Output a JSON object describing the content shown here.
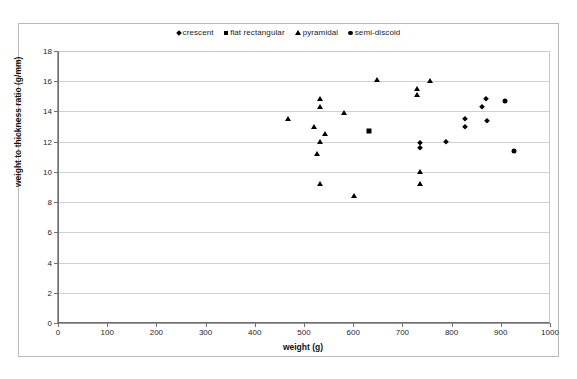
{
  "chart_data": {
    "type": "scatter",
    "title": "",
    "xlabel": "weight (g)",
    "ylabel": "weight to thickness ratio (g/mm)",
    "xlim": [
      0,
      1000
    ],
    "ylim": [
      0,
      18
    ],
    "xticks": [
      0,
      100,
      200,
      300,
      400,
      500,
      600,
      700,
      800,
      900,
      1000
    ],
    "yticks": [
      0,
      2,
      4,
      6,
      8,
      10,
      12,
      14,
      16,
      18
    ],
    "grid": "horizontal",
    "legend_position": "top-center",
    "series": [
      {
        "name": "crescent",
        "marker": "diamond",
        "color": "#000000",
        "points": [
          [
            827,
            13.5
          ],
          [
            827,
            13.0
          ],
          [
            870,
            14.8
          ],
          [
            862,
            14.3
          ],
          [
            872,
            13.4
          ],
          [
            736,
            11.9
          ],
          [
            736,
            11.6
          ],
          [
            789,
            12.0
          ]
        ]
      },
      {
        "name": "flat rectangular",
        "marker": "square",
        "color": "#000000",
        "points": [
          [
            633,
            12.7
          ]
        ]
      },
      {
        "name": "pyramidal",
        "marker": "triangle",
        "color": "#000000",
        "points": [
          [
            467,
            13.5
          ],
          [
            533,
            14.8
          ],
          [
            533,
            14.3
          ],
          [
            520,
            13.0
          ],
          [
            543,
            12.5
          ],
          [
            533,
            12.0
          ],
          [
            527,
            11.2
          ],
          [
            533,
            9.2
          ],
          [
            582,
            13.9
          ],
          [
            648,
            16.1
          ],
          [
            601,
            8.4
          ],
          [
            756,
            16.0
          ],
          [
            730,
            15.5
          ],
          [
            730,
            15.1
          ],
          [
            736,
            10.0
          ],
          [
            736,
            9.2
          ]
        ]
      },
      {
        "name": "semi-discoid",
        "marker": "circle",
        "color": "#000000",
        "points": [
          [
            908,
            14.7
          ],
          [
            927,
            11.4
          ]
        ]
      }
    ]
  },
  "legend": {
    "items": [
      {
        "label": "crescent",
        "marker": "diamond"
      },
      {
        "label": "flat rectangular",
        "marker": "square"
      },
      {
        "label": "pyramidal",
        "marker": "triangle"
      },
      {
        "label": "semi-discoid",
        "marker": "circle"
      }
    ]
  },
  "axes": {
    "x_title": "weight (g)",
    "y_title": "weight to thickness ratio (g/mm)"
  }
}
